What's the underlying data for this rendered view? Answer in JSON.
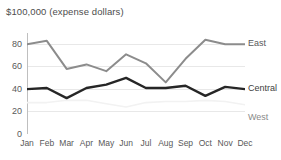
{
  "chart_data": {
    "type": "line",
    "title": "$100,000 (expense dollars)",
    "xlabel": "",
    "ylabel": "",
    "categories": [
      "Jan",
      "Feb",
      "Mar",
      "Apr",
      "May",
      "Jun",
      "Jul",
      "Aug",
      "Sep",
      "Oct",
      "Nov",
      "Dec"
    ],
    "ylim": [
      0,
      90
    ],
    "yticks": [
      0,
      20,
      40,
      60,
      80
    ],
    "ytick_labels": [
      "0",
      "20",
      "40",
      "60",
      "80"
    ],
    "grid": true,
    "legend_position": "right-inline",
    "series": [
      {
        "name": "East",
        "color": "#8c8c8c",
        "width": 2,
        "values": [
          80,
          83,
          58,
          62,
          56,
          71,
          63,
          46,
          67,
          84,
          80,
          80
        ]
      },
      {
        "name": "Central",
        "color": "#262626",
        "width": 2.4,
        "values": [
          40,
          41,
          32,
          41,
          44,
          50,
          41,
          41,
          43,
          34,
          42,
          40
        ]
      },
      {
        "name": "West",
        "color": "#f2f2f2",
        "width": 1.6,
        "values": [
          28,
          28,
          30,
          30,
          27,
          24,
          28,
          29,
          29,
          30,
          29,
          26
        ]
      }
    ]
  },
  "axis": {
    "y_labels": [
      "80",
      "60",
      "40",
      "20",
      "0"
    ],
    "x_labels": [
      "Jan",
      "Feb",
      "Mar",
      "Apr",
      "May",
      "Jun",
      "Jul",
      "Aug",
      "Sep",
      "Oct",
      "Nov",
      "Dec"
    ]
  },
  "legend": {
    "east": "East",
    "central": "Central",
    "west": "West"
  }
}
